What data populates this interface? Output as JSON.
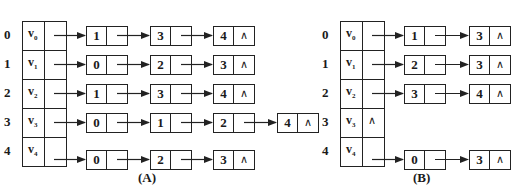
{
  "diagrams": [
    {
      "caption": "(A)",
      "vertices": [
        {
          "index": "0",
          "name": "v",
          "sub": "0",
          "null_ptr": false,
          "adj": [
            "1",
            "3",
            "4"
          ]
        },
        {
          "index": "1",
          "name": "v",
          "sub": "1",
          "null_ptr": false,
          "adj": [
            "0",
            "2",
            "3"
          ]
        },
        {
          "index": "2",
          "name": "v",
          "sub": "2",
          "null_ptr": false,
          "adj": [
            "1",
            "3",
            "4"
          ]
        },
        {
          "index": "3",
          "name": "v",
          "sub": "3",
          "null_ptr": false,
          "adj": [
            "0",
            "1",
            "2",
            "4"
          ]
        },
        {
          "index": "4",
          "name": "v",
          "sub": "4",
          "null_ptr": false,
          "adj": [
            "0",
            "2",
            "3"
          ]
        }
      ]
    },
    {
      "caption": "(B)",
      "vertices": [
        {
          "index": "0",
          "name": "v",
          "sub": "0",
          "null_ptr": false,
          "adj": [
            "1",
            "3"
          ]
        },
        {
          "index": "1",
          "name": "v",
          "sub": "1",
          "null_ptr": false,
          "adj": [
            "2",
            "3"
          ]
        },
        {
          "index": "2",
          "name": "v",
          "sub": "2",
          "null_ptr": false,
          "adj": [
            "3",
            "4"
          ]
        },
        {
          "index": "3",
          "name": "v",
          "sub": "3",
          "null_ptr": true,
          "adj": []
        },
        {
          "index": "4",
          "name": "v",
          "sub": "4",
          "null_ptr": false,
          "adj": [
            "0",
            "3"
          ]
        }
      ]
    }
  ],
  "null_symbol": "∧"
}
